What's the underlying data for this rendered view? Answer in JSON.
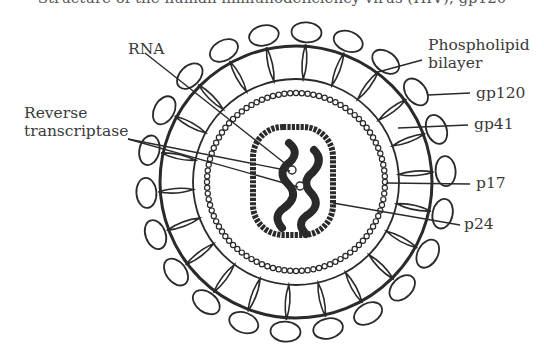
{
  "figure": {
    "title_partial": "Structure of the human immunodeficiency virus (HIV), gp120",
    "labels": {
      "rna": "RNA",
      "reverse_transcriptase_line1": "Reverse",
      "reverse_transcriptase_line2": "transcriptase",
      "phospholipid_line1": "Phospholipid",
      "phospholipid_line2": "bilayer",
      "gp120": "gp120",
      "gp41": "gp41",
      "p17": "p17",
      "p24": "p24"
    },
    "colors": {
      "line": "#2a2a2a",
      "text": "#3a3a3a",
      "background": "#ffffff"
    }
  }
}
